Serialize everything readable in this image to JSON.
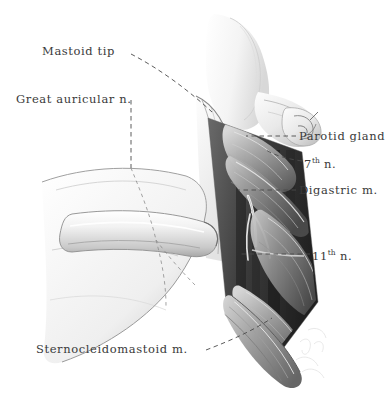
{
  "illustration": {
    "title": "Neck dissection — parotid and upper cervical region",
    "medium": "graphite pencil drawing",
    "background_color": "#ffffff",
    "ink_color": "#3a3a3a",
    "leader_line_style": "dashed"
  },
  "labels": {
    "mastoid_tip": "Mastoid tip",
    "great_auricular_nerve": "Great auricular n.",
    "parotid_gland": "Parotid gland",
    "seventh_nerve_number": "7",
    "seventh_nerve_ordinal": "th",
    "seventh_nerve_suffix": "n.",
    "digastric_muscle": "Digastric m.",
    "eleventh_nerve_number": "11",
    "eleventh_nerve_ordinal": "th",
    "eleventh_nerve_suffix": "n.",
    "sternocleidomastoid_muscle": "Sternocleidomastoid m."
  }
}
